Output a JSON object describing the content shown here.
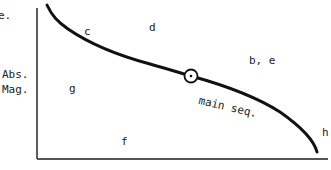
{
  "diagram": {
    "title_fragment": "e.",
    "y_axis_label": [
      "Abs.",
      "Mag."
    ],
    "curve_label": "main seq.",
    "region_labels": {
      "c": "c",
      "d": "d",
      "be": "b, e",
      "g": "g",
      "f": "f",
      "h": "h"
    },
    "marker": "sun-symbol",
    "colors": {
      "line": "#111111",
      "axis": "#333333",
      "text": "#222222"
    }
  }
}
